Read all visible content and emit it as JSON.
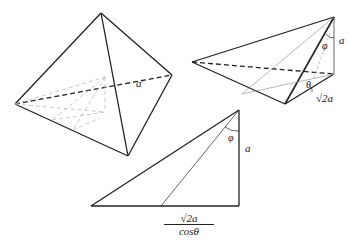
{
  "figures": {
    "tetrahedron": {
      "edge_label": "a"
    },
    "pyramid": {
      "height_label": "a",
      "base_label": "√2a",
      "angle_phi": "φ",
      "angle_theta": "θ"
    },
    "triangle": {
      "height_label": "a",
      "angle_phi": "φ",
      "base_numerator": "√2a",
      "base_denominator": "cosθ"
    }
  },
  "colors": {
    "line": "#222222",
    "hidden": "#aaaaaa"
  }
}
